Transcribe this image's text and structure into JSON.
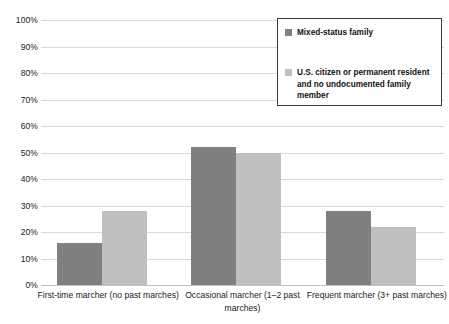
{
  "chart_data": {
    "type": "bar",
    "title": "",
    "xlabel": "",
    "ylabel": "",
    "ylim": [
      0,
      100
    ],
    "ytick_labels": [
      "100%",
      "90%",
      "80%",
      "70%",
      "60%",
      "50%",
      "40%",
      "30%",
      "20%",
      "10%",
      "0%"
    ],
    "ytick_values": [
      100,
      90,
      80,
      70,
      60,
      50,
      40,
      30,
      20,
      10,
      0
    ],
    "grid": true,
    "legend_position": "upper-right",
    "categories": [
      "First-time marcher (no past marches)",
      "Occasional marcher (1–2 past marches)",
      "Frequent marcher (3+ past marches)"
    ],
    "series": [
      {
        "name": "Mixed-status family",
        "color": "#7f7f7f",
        "values": [
          16,
          52,
          28
        ]
      },
      {
        "name": "U.S. citizen or permanent resident and no undocumented family member",
        "color": "#bfbfbf",
        "values": [
          28,
          50,
          22
        ]
      }
    ]
  },
  "legend": {
    "entries": [
      {
        "label": "Mixed-status family",
        "color": "#7f7f7f"
      },
      {
        "label": "U.S. citizen or permanent resident and no undocumented family member",
        "color": "#bfbfbf"
      }
    ]
  }
}
